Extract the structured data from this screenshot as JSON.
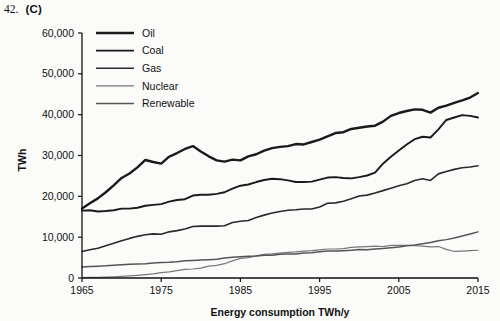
{
  "caption": {
    "question_number": "42.",
    "answer": "(C)"
  },
  "chart_data": {
    "type": "line",
    "title": "",
    "xlabel": "Energy consumption TWh/y",
    "ylabel": "TWh",
    "xlim": [
      1965,
      2015
    ],
    "ylim": [
      0,
      60000
    ],
    "xticks": [
      1965,
      1975,
      1985,
      1995,
      2005,
      2015
    ],
    "xtick_labels": [
      "1965",
      "1975",
      "1985",
      "1995",
      "2005",
      "2015"
    ],
    "yticks": [
      0,
      10000,
      20000,
      30000,
      40000,
      50000,
      60000
    ],
    "ytick_labels": [
      "0",
      "10,000",
      "20,000",
      "30,000",
      "40,000",
      "50,000",
      "60,000"
    ],
    "grid": false,
    "legend_position": "upper-left-inside",
    "x": [
      1965,
      1966,
      1967,
      1968,
      1969,
      1970,
      1971,
      1972,
      1973,
      1974,
      1975,
      1976,
      1977,
      1978,
      1979,
      1980,
      1981,
      1982,
      1983,
      1984,
      1985,
      1986,
      1987,
      1988,
      1989,
      1990,
      1991,
      1992,
      1993,
      1994,
      1995,
      1996,
      1997,
      1998,
      1999,
      2000,
      2001,
      2002,
      2003,
      2004,
      2005,
      2006,
      2007,
      2008,
      2009,
      2010,
      2011,
      2012,
      2013,
      2014,
      2015
    ],
    "series": [
      {
        "name": "Oil",
        "color": "#1a1a1a",
        "line_width": 2.4,
        "values": [
          17000,
          18300,
          19500,
          21000,
          22700,
          24500,
          25600,
          27100,
          28900,
          28400,
          28000,
          29700,
          30600,
          31600,
          32300,
          31000,
          29800,
          28800,
          28500,
          29000,
          28800,
          29800,
          30300,
          31200,
          31800,
          32100,
          32300,
          32800,
          32700,
          33300,
          33900,
          34700,
          35500,
          35700,
          36500,
          36800,
          37100,
          37300,
          38300,
          39700,
          40400,
          40900,
          41300,
          41200,
          40500,
          41700,
          42200,
          42900,
          43500,
          44200,
          45300
        ]
      },
      {
        "name": "Coal",
        "color": "#1a1a1a",
        "line_width": 1.9,
        "values": [
          16500,
          16600,
          16300,
          16400,
          16600,
          17000,
          17000,
          17200,
          17700,
          17900,
          18100,
          18700,
          19100,
          19300,
          20200,
          20400,
          20400,
          20600,
          21000,
          21900,
          22600,
          22900,
          23500,
          24000,
          24300,
          24200,
          23900,
          23500,
          23500,
          23600,
          24100,
          24600,
          24700,
          24500,
          24400,
          24700,
          25100,
          25800,
          28000,
          29700,
          31200,
          32700,
          34000,
          34600,
          34400,
          36400,
          38700,
          39300,
          39900,
          39700,
          39300
        ]
      },
      {
        "name": "Gas",
        "color": "#2a2a2a",
        "line_width": 1.6,
        "values": [
          6500,
          6900,
          7300,
          7900,
          8500,
          9100,
          9700,
          10200,
          10600,
          10800,
          10700,
          11300,
          11600,
          12000,
          12600,
          12700,
          12700,
          12700,
          12800,
          13600,
          13900,
          14100,
          14800,
          15400,
          15900,
          16300,
          16600,
          16700,
          16900,
          16900,
          17400,
          18300,
          18400,
          18800,
          19400,
          20100,
          20300,
          20800,
          21400,
          22000,
          22600,
          23100,
          23900,
          24300,
          23900,
          25500,
          26100,
          26600,
          27000,
          27200,
          27500
        ]
      },
      {
        "name": "Nuclear",
        "color": "#777777",
        "line_width": 1.2,
        "values": [
          100,
          130,
          170,
          230,
          300,
          400,
          520,
          660,
          820,
          1000,
          1300,
          1500,
          1800,
          2100,
          2200,
          2400,
          2900,
          3100,
          3500,
          4200,
          4800,
          5000,
          5400,
          5800,
          5900,
          6100,
          6300,
          6400,
          6600,
          6700,
          6900,
          7100,
          7100,
          7200,
          7500,
          7600,
          7700,
          7800,
          7700,
          8000,
          8000,
          8000,
          7900,
          7800,
          7600,
          7700,
          7000,
          6500,
          6600,
          6700,
          6800
        ]
      },
      {
        "name": "Renewable",
        "color": "#555555",
        "line_width": 1.5,
        "values": [
          2700,
          2800,
          2900,
          3000,
          3150,
          3250,
          3350,
          3450,
          3500,
          3650,
          3800,
          3850,
          4000,
          4200,
          4300,
          4400,
          4500,
          4600,
          4900,
          5100,
          5200,
          5300,
          5400,
          5600,
          5600,
          5800,
          5900,
          5900,
          6100,
          6200,
          6400,
          6600,
          6600,
          6700,
          6800,
          7000,
          6900,
          7100,
          7200,
          7400,
          7600,
          7900,
          8100,
          8400,
          8700,
          9100,
          9400,
          9800,
          10300,
          10800,
          11300
        ]
      }
    ]
  },
  "legend": {
    "items": [
      {
        "label": "Oil"
      },
      {
        "label": "Coal"
      },
      {
        "label": "Gas"
      },
      {
        "label": "Nuclear"
      },
      {
        "label": "Renewable"
      }
    ]
  }
}
